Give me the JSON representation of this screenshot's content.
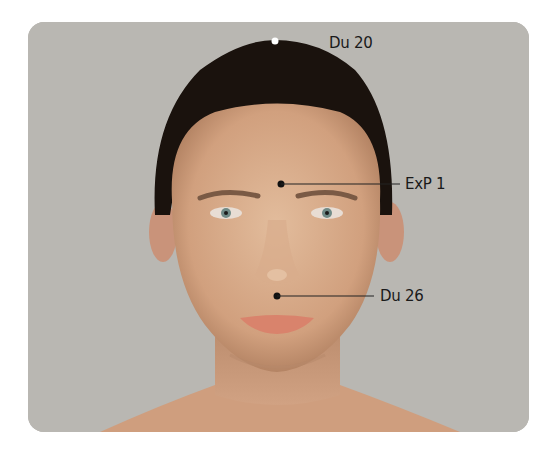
{
  "figure": {
    "background_color": "#b9b7b2",
    "points": [
      {
        "id": "du20",
        "label": "Du 20",
        "dot_color": "#ffffff",
        "location": "vertex of head"
      },
      {
        "id": "exp1",
        "label": "ExP 1",
        "dot_color": "#111111",
        "location": "between eyebrows"
      },
      {
        "id": "du26",
        "label": "Du 26",
        "dot_color": "#111111",
        "location": "philtrum above upper lip"
      }
    ]
  }
}
